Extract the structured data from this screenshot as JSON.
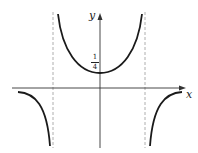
{
  "diagram": {
    "type": "function-graph",
    "axes": {
      "x_label": "x",
      "y_label": "y"
    },
    "annotations": {
      "y_intercept_numerator": "1",
      "y_intercept_denominator": "4"
    },
    "asymptotes": "two vertical dashed lines, symmetric about y-axis",
    "colors": {
      "curve": "#1a1a1a",
      "axis": "#333333",
      "asymptote": "#999999"
    }
  }
}
